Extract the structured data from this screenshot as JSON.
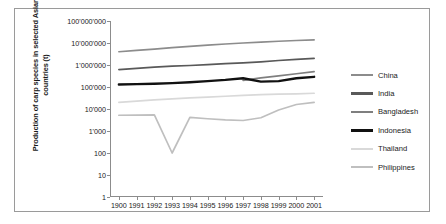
{
  "axis_title_y": "Production of carp species in selected Asian countries (t)",
  "legend": [
    {
      "label": "China",
      "color": "#8c8c8c",
      "width": 2.6
    },
    {
      "label": "India",
      "color": "#595959",
      "width": 2.6
    },
    {
      "label": "Bangladesh",
      "color": "#7f7f7f",
      "width": 2.6
    },
    {
      "label": "Indonesia",
      "color": "#111111",
      "width": 2.8
    },
    {
      "label": "Thailand",
      "color": "#d9d9d9",
      "width": 2.0
    },
    {
      "label": "Philippines",
      "color": "#bfbfbf",
      "width": 2.2
    }
  ],
  "y_tick_labels": [
    "100'000'000",
    "10'000'000",
    "1'000'000",
    "100'000",
    "10'000",
    "1'000",
    "100",
    "10",
    "1"
  ],
  "x_tick_labels": [
    "1900",
    "1991",
    "1992",
    "1993",
    "1994",
    "1995",
    "1996",
    "1997",
    "1998",
    "1999",
    "2000",
    "2001"
  ],
  "chart_data": {
    "type": "line",
    "title": "",
    "xlabel": "",
    "ylabel": "Production of carp species in selected Asian countries (t)",
    "yscale": "log",
    "ylim": [
      1,
      100000000
    ],
    "y_ticks": [
      1,
      10,
      100,
      1000,
      10000,
      100000,
      1000000,
      10000000,
      100000000
    ],
    "grid": false,
    "legend_position": "right",
    "x": [
      1990,
      1991,
      1992,
      1993,
      1994,
      1995,
      1996,
      1997,
      1998,
      1999,
      2000,
      2001
    ],
    "x_labels_as_shown": [
      "1900",
      "1991",
      "1992",
      "1993",
      "1994",
      "1995",
      "1996",
      "1997",
      "1998",
      "1999",
      "2000",
      "2001"
    ],
    "series": [
      {
        "name": "China",
        "color": "#8c8c8c",
        "values": [
          4000000,
          4600000,
          5300000,
          6200000,
          7000000,
          8000000,
          9000000,
          10000000,
          11000000,
          12000000,
          13000000,
          14000000
        ]
      },
      {
        "name": "India",
        "color": "#595959",
        "values": [
          620000,
          700000,
          800000,
          880000,
          950000,
          1050000,
          1150000,
          1250000,
          1400000,
          1600000,
          1800000,
          2000000
        ]
      },
      {
        "name": "Bangladesh",
        "color": "#7f7f7f",
        "values": [
          null,
          null,
          null,
          null,
          null,
          null,
          null,
          200000,
          260000,
          320000,
          400000,
          500000
        ]
      },
      {
        "name": "Indonesia",
        "color": "#111111",
        "values": [
          130000,
          135000,
          140000,
          150000,
          165000,
          185000,
          210000,
          250000,
          175000,
          185000,
          250000,
          290000
        ]
      },
      {
        "name": "Thailand",
        "color": "#d9d9d9",
        "values": [
          20000,
          23000,
          26000,
          29000,
          32000,
          35000,
          38000,
          42000,
          45000,
          47000,
          49000,
          52000
        ]
      },
      {
        "name": "Philippines",
        "color": "#bfbfbf",
        "values": [
          5200,
          5300,
          5400,
          100,
          4200,
          3600,
          3200,
          3000,
          4000,
          9000,
          16000,
          20000
        ]
      }
    ]
  }
}
